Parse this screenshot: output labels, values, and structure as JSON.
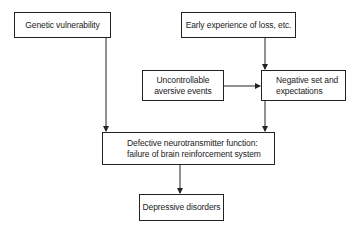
{
  "diagram": {
    "nodes": [
      {
        "id": "genetic",
        "label": "Genetic vulnerability"
      },
      {
        "id": "early",
        "label": "Early experience of loss, etc."
      },
      {
        "id": "uncontrollable",
        "label_line1": "Uncontrollable",
        "label_line2": "aversive events"
      },
      {
        "id": "negative",
        "label_line1": "Negative set and",
        "label_line2": "expectations"
      },
      {
        "id": "defective",
        "label_line1": "Defective neurotransmitter function:",
        "label_line2": "failure of brain reinforcement system"
      },
      {
        "id": "depressive",
        "label": "Depressive disorders"
      }
    ],
    "edges": [
      {
        "from": "genetic",
        "to": "defective"
      },
      {
        "from": "early",
        "to": "negative"
      },
      {
        "from": "uncontrollable",
        "to": "negative"
      },
      {
        "from": "negative",
        "to": "defective"
      },
      {
        "from": "defective",
        "to": "depressive"
      }
    ],
    "colors": {
      "stroke": "#222222",
      "background": "#ffffff"
    }
  }
}
